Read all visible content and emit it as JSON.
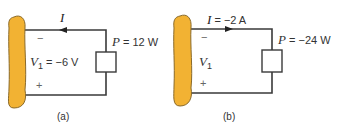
{
  "colors": {
    "wire": "#3a3a3a",
    "blob_fill": "#f2b233",
    "blob_stroke": "#8a6a2a",
    "text": "#333333"
  },
  "circuits": [
    {
      "id": "a",
      "caption": "(a)",
      "current": {
        "symbol": "I",
        "value_text": "",
        "arrow_direction": "left"
      },
      "power": {
        "symbol": "P",
        "eq": " = ",
        "value": "12 W"
      },
      "voltage": {
        "symbol": "V",
        "subscript": "1",
        "eq": " = ",
        "value": "−6 V"
      },
      "polarity_top": "−",
      "polarity_bottom": "+"
    },
    {
      "id": "b",
      "caption": "(b)",
      "current": {
        "symbol": "I",
        "value_text": " = −2 A",
        "arrow_direction": "right"
      },
      "power": {
        "symbol": "P",
        "eq": " = ",
        "value": "−24 W"
      },
      "voltage": {
        "symbol": "V",
        "subscript": "1",
        "eq": "",
        "value": ""
      },
      "polarity_top": "−",
      "polarity_bottom": "+"
    }
  ]
}
